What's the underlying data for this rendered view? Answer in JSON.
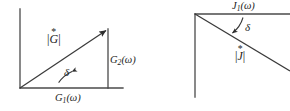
{
  "figure": {
    "kind": "vector-diagram-pair",
    "background_color": "#ffffff",
    "line_color": "#3a3a3a",
    "text_color": "#1c1c1c"
  },
  "left_diagram": {
    "name": "complex-modulus-triangle",
    "axis_vertical_label": "",
    "hypotenuse_label_base": "G",
    "hypotenuse_label_star": "*",
    "hypotenuse_label_bar": "|",
    "angle_label": "δ",
    "horizontal_component_base": "G",
    "horizontal_component_sub": "1",
    "horizontal_component_arg": "(ω)",
    "vertical_component_base": "G",
    "vertical_component_sub": "2",
    "vertical_component_arg": "(ω)",
    "origin": {
      "x": 20,
      "y": 88
    },
    "arrow_tip": {
      "x": 108,
      "y": 29
    }
  },
  "right_diagram": {
    "name": "complex-compliance-triangle",
    "hypotenuse_label_base": "J",
    "hypotenuse_label_star": "*",
    "angle_label": "δ",
    "top_component_base": "J",
    "top_component_sub": "1",
    "top_component_arg": "(ω)",
    "corner": {
      "x": 195,
      "y": 14
    },
    "vertical_end": {
      "x": 195,
      "y": 97
    }
  }
}
